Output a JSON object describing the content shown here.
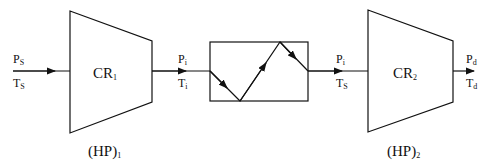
{
  "diagram": {
    "compressor1": {
      "label": "CR",
      "sub": "1",
      "power_label": "(HP)",
      "power_sub": "1"
    },
    "compressor2": {
      "label": "CR",
      "sub": "2",
      "power_label": "(HP)",
      "power_sub": "2"
    },
    "inlet": {
      "p": "P",
      "p_sub": "S",
      "t": "T",
      "t_sub": "S"
    },
    "after_cr1": {
      "p": "P",
      "p_sub": "i",
      "t": "T",
      "t_sub": "i"
    },
    "after_cooler": {
      "p": "P",
      "p_sub": "i",
      "t": "T",
      "t_sub": "S"
    },
    "outlet": {
      "p": "P",
      "p_sub": "d",
      "t": "T",
      "t_sub": "d"
    },
    "intercooler": {
      "name": "intercooler"
    }
  }
}
